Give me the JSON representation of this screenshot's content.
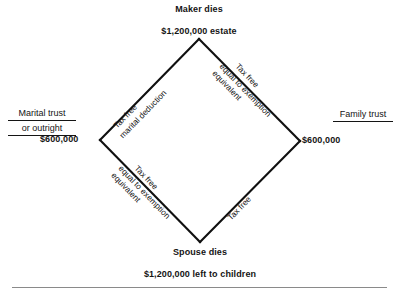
{
  "diagram": {
    "title_top": "Maker dies",
    "apex_value": "$1,200,000 estate",
    "bottom_event": "Spouse dies",
    "bottom_value": "$1,200,000 left to children",
    "left_value": "$600,000",
    "right_value": "$600,000",
    "left_trust": {
      "line1": "Marital trust",
      "line2": "or outright"
    },
    "right_trust": {
      "line1": "Family trust"
    },
    "edges": {
      "upper_left": {
        "above": "Tax free",
        "below": "marital deduction"
      },
      "upper_right": {
        "above": "Tax free",
        "below_line1": "equal to exemption",
        "below_line2": "equivalent"
      },
      "lower_left": {
        "above": "Tax free",
        "below_line1": "equal to exemption",
        "below_line2": "equivalent"
      },
      "lower_right": {
        "above": "Tax free"
      }
    },
    "colors": {
      "stroke": "#101010",
      "text": "#141414",
      "background": "#ffffff",
      "rule": "#8a8a8a"
    },
    "geometry": {
      "top_vertex": [
        199,
        39
      ],
      "left_vertex": [
        100,
        140
      ],
      "right_vertex": [
        300,
        141
      ],
      "bottom_vertex": [
        200,
        242
      ]
    }
  }
}
